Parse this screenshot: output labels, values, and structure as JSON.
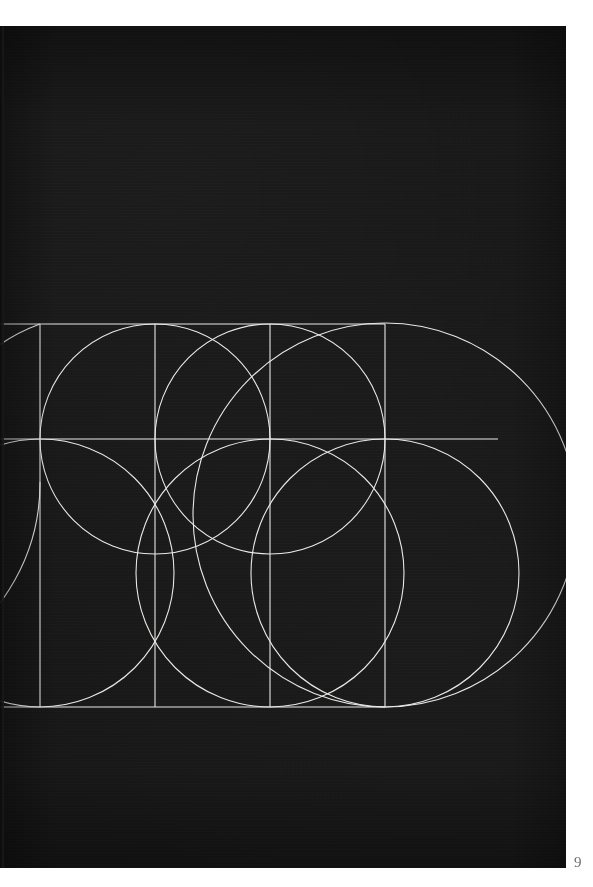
{
  "page": {
    "folio": "9",
    "plate_background_color": "#161616",
    "paper_color": "#ffffff",
    "stroke_color": "#e8e8e6",
    "plate_rect": {
      "x": 0,
      "y": 26,
      "width": 566,
      "height": 842
    }
  },
  "figure": {
    "title": "Geometric letterform construction grid",
    "stroke_width": 1.1,
    "grid": {
      "top_rule_y": 272,
      "middle_rule_y": 387,
      "bottom_rule_y": 655,
      "vertical_rules_x": [
        40,
        155,
        270,
        385
      ],
      "left_clip_x": 0,
      "right_extent_x": 498
    },
    "rules": [
      {
        "name": "top-rule",
        "orientation": "horizontal",
        "y": 272,
        "x1": 0,
        "x2": 385
      },
      {
        "name": "middle-rule",
        "orientation": "horizontal",
        "y": 387,
        "x1": 0,
        "x2": 498
      },
      {
        "name": "bottom-rule",
        "orientation": "horizontal",
        "y": 655,
        "x1": 0,
        "x2": 385
      },
      {
        "name": "vertical-rule-1",
        "orientation": "vertical",
        "x": 40,
        "y1": 272,
        "y2": 655
      },
      {
        "name": "vertical-rule-2",
        "orientation": "vertical",
        "x": 155,
        "y1": 272,
        "y2": 655
      },
      {
        "name": "vertical-rule-3",
        "orientation": "vertical",
        "x": 270,
        "y1": 272,
        "y2": 655
      },
      {
        "name": "vertical-rule-4",
        "orientation": "vertical",
        "x": 385,
        "y1": 272,
        "y2": 655
      }
    ],
    "circles": [
      {
        "name": "circle-upper-left",
        "cx": 155,
        "cy": 387,
        "r": 115
      },
      {
        "name": "circle-upper-middle",
        "cx": 270,
        "cy": 387,
        "r": 115
      },
      {
        "name": "circle-lower-left",
        "cx": 40,
        "cy": 521,
        "r": 134
      },
      {
        "name": "circle-lower-middle",
        "cx": 270,
        "cy": 521,
        "r": 134
      },
      {
        "name": "circle-lower-right",
        "cx": 385,
        "cy": 521,
        "r": 134
      },
      {
        "name": "circle-large-right",
        "cx": 385,
        "cy": 463,
        "r": 192
      }
    ],
    "arcs": [
      {
        "name": "arc-left-sweep-upper",
        "d": "M -60 387 A 115 115 0 0 1 40 272"
      },
      {
        "name": "arc-left-sweep-lower",
        "d": "M -60 655 A 180 180 0 0 0 40 470"
      }
    ]
  }
}
